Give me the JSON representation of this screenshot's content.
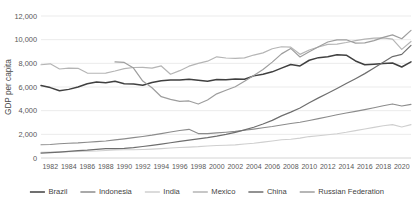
{
  "chart_data": {
    "type": "line",
    "title": "",
    "xlabel": "",
    "ylabel": "GDP per capita",
    "ylim": [
      0,
      12000
    ],
    "ytick_values": [
      0,
      2000,
      4000,
      6000,
      8000,
      10000,
      12000
    ],
    "ytick_labels": [
      "0",
      "2,000",
      "4,000",
      "6,000",
      "8,000",
      "10,000",
      "12,000"
    ],
    "grid": true,
    "legend_position": "bottom",
    "x_start": 1981,
    "x_end": 2021,
    "xtick_labels": [
      "1982",
      "1984",
      "1986",
      "1988",
      "1990",
      "1992",
      "1994",
      "1996",
      "1998",
      "2000",
      "2002",
      "2004",
      "2006",
      "2008",
      "2010",
      "2012",
      "2014",
      "2016",
      "2018",
      "2020"
    ],
    "xtick_values": [
      1982,
      1984,
      1986,
      1988,
      1990,
      1992,
      1994,
      1996,
      1998,
      2000,
      2002,
      2004,
      2006,
      2008,
      2010,
      2012,
      2014,
      2016,
      2018,
      2020
    ],
    "x": [
      1981,
      1982,
      1983,
      1984,
      1985,
      1986,
      1987,
      1988,
      1989,
      1990,
      1991,
      1992,
      1993,
      1994,
      1995,
      1996,
      1997,
      1998,
      1999,
      2000,
      2001,
      2002,
      2003,
      2004,
      2005,
      2006,
      2007,
      2008,
      2009,
      2010,
      2011,
      2012,
      2013,
      2014,
      2015,
      2016,
      2017,
      2018,
      2019,
      2020,
      2021
    ],
    "series": [
      {
        "name": "Brazil",
        "color": "#404040",
        "width": 1.5,
        "values": [
          6120,
          5950,
          5680,
          5800,
          6000,
          6280,
          6420,
          6350,
          6480,
          6280,
          6250,
          6150,
          6380,
          6520,
          6600,
          6600,
          6650,
          6560,
          6480,
          6640,
          6620,
          6680,
          6660,
          6940,
          7080,
          7280,
          7600,
          7900,
          7780,
          8260,
          8480,
          8550,
          8720,
          8690,
          8200,
          7880,
          7930,
          7990,
          8030,
          7690,
          8120
        ]
      },
      {
        "name": "Indonesia",
        "color": "#8c8c8c",
        "width": 1.1,
        "values": [
          1120,
          1140,
          1200,
          1250,
          1280,
          1330,
          1380,
          1440,
          1530,
          1620,
          1720,
          1820,
          1930,
          2060,
          2200,
          2330,
          2420,
          2060,
          2060,
          2120,
          2180,
          2250,
          2340,
          2440,
          2550,
          2660,
          2790,
          2920,
          3020,
          3170,
          3330,
          3490,
          3650,
          3800,
          3940,
          4090,
          4250,
          4420,
          4570,
          4390,
          4530
        ]
      },
      {
        "name": "India",
        "color": "#cfcfcf",
        "width": 1.1,
        "values": [
          480,
          495,
          520,
          535,
          555,
          575,
          595,
          640,
          670,
          700,
          695,
          720,
          750,
          790,
          840,
          890,
          920,
          960,
          1020,
          1050,
          1080,
          1110,
          1180,
          1250,
          1340,
          1440,
          1540,
          1580,
          1680,
          1810,
          1880,
          1960,
          2050,
          2170,
          2310,
          2450,
          2590,
          2730,
          2820,
          2620,
          2820
        ]
      },
      {
        "name": "Mexico",
        "color": "#b5b5b5",
        "width": 1.2,
        "values": [
          7880,
          7960,
          7520,
          7600,
          7580,
          7180,
          7160,
          7180,
          7350,
          7550,
          7650,
          7660,
          7600,
          7780,
          7080,
          7380,
          7760,
          8000,
          8180,
          8550,
          8450,
          8420,
          8460,
          8700,
          8880,
          9230,
          9400,
          9370,
          8760,
          9130,
          9380,
          9600,
          9620,
          9760,
          9920,
          10050,
          10130,
          10150,
          10050,
          9180,
          9850
        ]
      },
      {
        "name": "China",
        "color": "#6e6e6e",
        "width": 1.2,
        "values": [
          420,
          455,
          500,
          560,
          620,
          660,
          730,
          790,
          800,
          820,
          880,
          970,
          1070,
          1180,
          1290,
          1400,
          1510,
          1610,
          1720,
          1850,
          2000,
          2170,
          2380,
          2600,
          2870,
          3180,
          3560,
          3880,
          4220,
          4670,
          5080,
          5470,
          5870,
          6290,
          6700,
          7130,
          7600,
          8090,
          8570,
          8760,
          9520
        ]
      },
      {
        "name": "Russian Federation",
        "color": "#9e9e9e",
        "width": 1.2,
        "values": [
          null,
          null,
          null,
          null,
          null,
          null,
          null,
          null,
          8120,
          8080,
          7600,
          6500,
          5940,
          5180,
          4960,
          4780,
          4820,
          4560,
          4900,
          5420,
          5720,
          6020,
          6480,
          6980,
          7480,
          8100,
          8800,
          9260,
          8540,
          8980,
          9400,
          9800,
          9980,
          9990,
          9710,
          9730,
          9920,
          10190,
          10400,
          10080,
          10790
        ]
      }
    ]
  },
  "axes": {
    "y_title": "GDP per capita"
  },
  "legend": {
    "items": [
      {
        "label": "Brazil",
        "color": "#404040"
      },
      {
        "label": "Indonesia",
        "color": "#8c8c8c"
      },
      {
        "label": "India",
        "color": "#cfcfcf"
      },
      {
        "label": "Mexico",
        "color": "#b5b5b5"
      },
      {
        "label": "China",
        "color": "#6e6e6e"
      },
      {
        "label": "Russian Federation",
        "color": "#9e9e9e"
      }
    ]
  }
}
